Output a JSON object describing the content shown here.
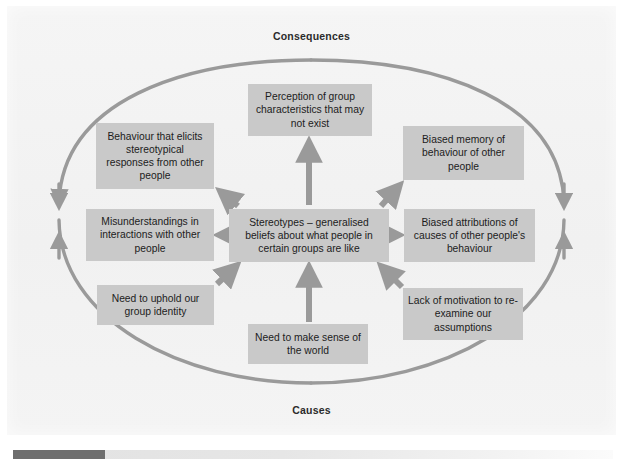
{
  "figure": {
    "title_top": "Consequences",
    "title_bottom": "Causes",
    "accent_color": "#9a9a9a",
    "node_fill": "#c9c9c9",
    "text_color": "#1c1c1c",
    "page_background": "#f3f3f3"
  },
  "nodes": {
    "centre": "Stereotypes – generalised beliefs about what people in certain groups are like",
    "perception": "Perception of group characteristics that may not exist",
    "behaviour": "Behaviour that elicits stereotypical responses from other people",
    "memory": "Biased memory of behaviour of other people",
    "misunderstandings": "Misunderstandings in interactions with other people",
    "attributions": "Biased attributions of causes of other people's behaviour",
    "uphold": "Need to uphold our group identity",
    "lack": "Lack of motivation to re-examine our assumptions",
    "sense": "Need to make sense of the world"
  },
  "icons": {
    "loop_arrow": "loop-arrow-icon",
    "arrow_up": "arrow-up-icon",
    "arrow_down": "arrow-down-icon",
    "arrow_left": "arrow-left-icon",
    "arrow_right": "arrow-right-icon",
    "arrow_diagonal": "arrow-diagonal-icon"
  },
  "scrollbar": {
    "orientation": "horizontal",
    "thumb_color": "#6e6e6e",
    "track_color": "#e6e6e6"
  }
}
